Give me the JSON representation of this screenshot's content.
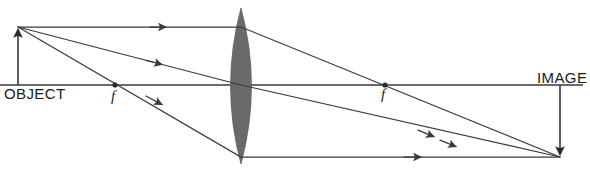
{
  "diagram": {
    "width": 590,
    "height": 173,
    "background_color": "#ffffff",
    "stroke_color": "#3a3a3a",
    "lens_fill_color": "#6a6a6a",
    "text_color": "#1c1c1c"
  },
  "labels": {
    "object": "OBJECT",
    "image": "IMAGE",
    "focal_left": "f",
    "focal_right": "f"
  },
  "optics": {
    "principal_axis": {
      "x1": 0,
      "y1": 85,
      "x2": 583,
      "y2": 85
    },
    "lens": {
      "center_x": 241,
      "top_y": 8,
      "bottom_y": 164,
      "half_width": 19
    },
    "object": {
      "base_x": 18,
      "base_y": 85,
      "tip_x": 18,
      "tip_y": 27,
      "height": 58,
      "orientation": "upright"
    },
    "image": {
      "base_x": 560,
      "base_y": 85,
      "tip_x": 560,
      "tip_y": 157,
      "height": 72,
      "orientation": "inverted"
    },
    "focal_points": [
      {
        "name": "focal_left",
        "x": 115,
        "y": 85
      },
      {
        "name": "focal_right",
        "x": 385,
        "y": 85
      }
    ],
    "rays": [
      {
        "name": "parallel-ray",
        "description": "Parallel to axis before lens, refracted through far focal point",
        "points": [
          [
            18,
            27
          ],
          [
            241,
            27
          ],
          [
            560,
            157
          ]
        ],
        "arrow_positions": [
          [
            163,
            27
          ],
          [
            452,
            145
          ]
        ]
      },
      {
        "name": "center-ray",
        "description": "Straight through optical center of lens",
        "points": [
          [
            18,
            27
          ],
          [
            241,
            85
          ],
          [
            560,
            157
          ]
        ],
        "arrow_positions": [
          [
            160,
            64
          ],
          [
            430,
            134
          ]
        ]
      },
      {
        "name": "focal-ray",
        "description": "Through near focal point, emerges parallel to axis",
        "points": [
          [
            18,
            27
          ],
          [
            241,
            157
          ],
          [
            560,
            157
          ]
        ],
        "arrow_positions": [
          [
            160,
            102
          ],
          [
            418,
            157
          ]
        ]
      }
    ]
  }
}
